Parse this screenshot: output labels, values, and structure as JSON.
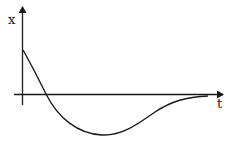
{
  "diagram": {
    "type": "function-graph",
    "axes": {
      "y_label": "x",
      "x_label": "t"
    },
    "curve": {
      "start": "positive value at t=0",
      "zero_crossing": "early",
      "minimum": "single negative undershoot",
      "end": "approaches zero from below"
    }
  },
  "colors": {
    "stroke": "#1a1a1a",
    "background": "#ffffff"
  }
}
